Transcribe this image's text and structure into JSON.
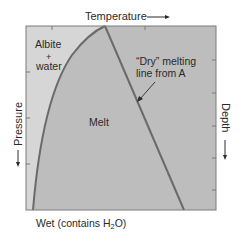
{
  "diagram": {
    "top_axis_label": "Temperature",
    "left_axis_label": "Pressure",
    "right_axis_label": "Depth",
    "bottom_label_prefix": "Wet (contains H",
    "bottom_label_sub": "2",
    "bottom_label_suffix": "O)",
    "regions": {
      "albite_line1": "Albite",
      "albite_line2": "+",
      "albite_line3": "water",
      "melt": "Melt"
    },
    "annotation": {
      "line1": "“Dry” melting",
      "line2": "line from A"
    },
    "colors": {
      "albite_region": "#d6d6d6",
      "melt_region": "#bdbdbd",
      "curve": "#6a6a6a",
      "frame": "#7a7a7a"
    }
  }
}
